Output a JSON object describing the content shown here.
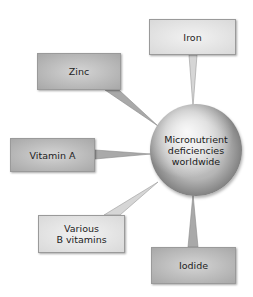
{
  "center": {
    "lines": [
      "Micronutrient",
      "deficiencies",
      "worldwide"
    ],
    "icon": "globe-icon"
  },
  "nodes": [
    {
      "id": "iron",
      "label": "Iron"
    },
    {
      "id": "zinc",
      "label": "Zinc"
    },
    {
      "id": "vitamin-a",
      "label": "Vitamin A"
    },
    {
      "id": "various-b",
      "lines": [
        "Various",
        "B vitamins"
      ]
    },
    {
      "id": "iodide",
      "label": "Iodide"
    }
  ],
  "colors": {
    "box_light": "#e6e6e6",
    "box_mid": "#b8b8b8",
    "connector": "#c8c8c8",
    "text": "#222222"
  }
}
